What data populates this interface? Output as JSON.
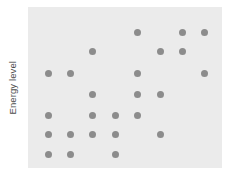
{
  "chart": {
    "ylabel": "Energy level",
    "xlabel": "",
    "panel_color": "#ebebeb",
    "point_color": "#8c8c8c",
    "background_color": "#ffffff"
  },
  "chart_data": {
    "type": "scatter",
    "title": "",
    "subtitle": "",
    "xlabel": "",
    "ylabel": "Energy level",
    "grid": false,
    "legend": null,
    "annotations": [],
    "xlim": [
      0.5,
      9.5
    ],
    "ylim": [
      0.5,
      7.5
    ],
    "x_tick_labels": [],
    "y_tick_labels": [],
    "axis_lines": false,
    "point_color": "#8c8c8c",
    "point_size": 7,
    "n_points": 22,
    "note": "Discrete lattice of points on a 9-column by 7-row grid; x counted left-to-right (1..9), y counted bottom-to-top (1..7).",
    "x": [
      5,
      7,
      8,
      3,
      6,
      7,
      1,
      2,
      5,
      8,
      3,
      5,
      6,
      1,
      3,
      4,
      5,
      1,
      2,
      3,
      4,
      6,
      1,
      2,
      4
    ],
    "y": [
      7,
      7,
      7,
      6,
      6,
      6,
      5,
      5,
      5,
      5,
      4,
      4,
      4,
      3,
      3,
      3,
      3,
      2,
      2,
      2,
      2,
      2,
      1,
      1,
      1
    ],
    "rows": [
      {
        "row": 7,
        "label": "",
        "columns": [
          5,
          7,
          8
        ]
      },
      {
        "row": 6,
        "label": "",
        "columns": [
          3,
          6,
          7
        ]
      },
      {
        "row": 5,
        "label": "",
        "columns": [
          1,
          2,
          5,
          8
        ]
      },
      {
        "row": 4,
        "label": "",
        "columns": [
          3,
          5,
          6
        ]
      },
      {
        "row": 3,
        "label": "",
        "columns": [
          1,
          3,
          4,
          5
        ]
      },
      {
        "row": 2,
        "label": "",
        "columns": [
          1,
          2,
          3,
          4,
          6
        ]
      },
      {
        "row": 1,
        "label": "",
        "columns": [
          1,
          2,
          4
        ]
      }
    ],
    "columns": [
      1,
      2,
      3,
      4,
      5,
      6,
      7,
      8,
      9
    ],
    "column_x_px": [
      48,
      70,
      92,
      115,
      137,
      160,
      182,
      204,
      226
    ],
    "row_y_px": [
      154,
      134,
      115,
      94,
      73,
      51,
      32
    ]
  }
}
